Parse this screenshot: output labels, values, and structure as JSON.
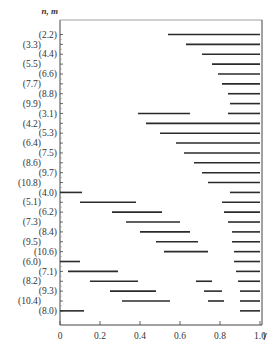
{
  "chart_data": {
    "type": "bar",
    "subtype": "horizontal-range-segments",
    "title": "",
    "ylabel": "n, m",
    "xlabel": "γ",
    "xlim": [
      0,
      1.0
    ],
    "x_ticks": [
      "0",
      "0.2",
      "0.4",
      "0.6",
      "0.8",
      "1.0"
    ],
    "grid": false,
    "legend": null,
    "categories": [
      "(2.2)",
      "(3.3)",
      "(4.4)",
      "(5.5)",
      "(6.6)",
      "(7.7)",
      "(8.8)",
      "(9.9)",
      "(3.1)",
      "(4.2)",
      "(5.3)",
      "(6.4)",
      "(7.5)",
      "(8.6)",
      "(9.7)",
      "(10.8)",
      "(4.0)",
      "(5.1)",
      "(6.2)",
      "(7.3)",
      "(8.4)",
      "(9.5)",
      "(10.6)",
      "(6.0)",
      "(7.1)",
      "(8.2)",
      "(9.3)",
      "(10.4)",
      "(8.0)"
    ],
    "rows": [
      {
        "label": "(2.2)",
        "segments": [
          [
            0.54,
            1.0
          ]
        ]
      },
      {
        "label": "(3.3)",
        "segments": [
          [
            0.63,
            1.0
          ]
        ]
      },
      {
        "label": "(4.4)",
        "segments": [
          [
            0.71,
            1.0
          ]
        ]
      },
      {
        "label": "(5.5)",
        "segments": [
          [
            0.76,
            1.0
          ]
        ]
      },
      {
        "label": "(6.6)",
        "segments": [
          [
            0.79,
            1.0
          ]
        ]
      },
      {
        "label": "(7.7)",
        "segments": [
          [
            0.81,
            1.0
          ]
        ]
      },
      {
        "label": "(8.8)",
        "segments": [
          [
            0.84,
            1.0
          ]
        ]
      },
      {
        "label": "(9.9)",
        "segments": [
          [
            0.85,
            1.0
          ]
        ]
      },
      {
        "label": "(3.1)",
        "segments": [
          [
            0.39,
            0.65
          ],
          [
            0.84,
            1.0
          ]
        ]
      },
      {
        "label": "(4.2)",
        "segments": [
          [
            0.43,
            1.0
          ]
        ]
      },
      {
        "label": "(5.3)",
        "segments": [
          [
            0.5,
            1.0
          ]
        ]
      },
      {
        "label": "(6.4)",
        "segments": [
          [
            0.58,
            1.0
          ]
        ]
      },
      {
        "label": "(7.5)",
        "segments": [
          [
            0.62,
            1.0
          ]
        ]
      },
      {
        "label": "(8.6)",
        "segments": [
          [
            0.67,
            1.0
          ]
        ]
      },
      {
        "label": "(9.7)",
        "segments": [
          [
            0.71,
            1.0
          ]
        ]
      },
      {
        "label": "(10.8)",
        "segments": [
          [
            0.74,
            1.0
          ]
        ]
      },
      {
        "label": "(4.0)",
        "segments": [
          [
            0.0,
            0.11
          ],
          [
            0.85,
            1.0
          ]
        ]
      },
      {
        "label": "(5.1)",
        "segments": [
          [
            0.1,
            0.38
          ],
          [
            0.81,
            1.0
          ]
        ]
      },
      {
        "label": "(6.2)",
        "segments": [
          [
            0.26,
            0.51
          ],
          [
            0.82,
            1.0
          ]
        ]
      },
      {
        "label": "(7.3)",
        "segments": [
          [
            0.33,
            0.6
          ],
          [
            0.84,
            1.0
          ]
        ]
      },
      {
        "label": "(8.4)",
        "segments": [
          [
            0.4,
            0.65
          ],
          [
            0.86,
            1.0
          ]
        ]
      },
      {
        "label": "(9.5)",
        "segments": [
          [
            0.48,
            0.69
          ],
          [
            0.86,
            1.0
          ]
        ]
      },
      {
        "label": "(10.6)",
        "segments": [
          [
            0.52,
            0.74
          ],
          [
            0.87,
            1.0
          ]
        ]
      },
      {
        "label": "(6.0)",
        "segments": [
          [
            0.0,
            0.1
          ],
          [
            0.87,
            1.0
          ]
        ]
      },
      {
        "label": "(7.1)",
        "segments": [
          [
            0.04,
            0.29
          ],
          [
            0.88,
            1.0
          ]
        ]
      },
      {
        "label": "(8.2)",
        "segments": [
          [
            0.15,
            0.39
          ],
          [
            0.68,
            0.76
          ],
          [
            0.89,
            1.0
          ]
        ]
      },
      {
        "label": "(9.3)",
        "segments": [
          [
            0.25,
            0.48
          ],
          [
            0.72,
            0.81
          ],
          [
            0.9,
            1.0
          ]
        ]
      },
      {
        "label": "(10.4)",
        "segments": [
          [
            0.31,
            0.55
          ],
          [
            0.74,
            0.82
          ],
          [
            0.9,
            1.0
          ]
        ]
      },
      {
        "label": "(8.0)",
        "segments": [
          [
            0.0,
            0.12
          ],
          [
            0.9,
            1.0
          ]
        ]
      }
    ]
  },
  "style": {
    "bar_color": "#2b2b2b",
    "axis_color": "#444444",
    "text_color": "#333333"
  }
}
